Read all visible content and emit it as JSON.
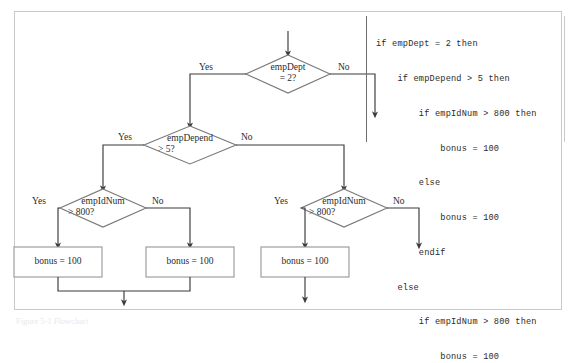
{
  "figure": {
    "caption": "Figure 5-1  Flowchart",
    "frame_color": "#c9c9c9"
  },
  "code": {
    "lines": [
      "if empDept = 2 then",
      "    if empDepend > 5 then",
      "        if empIdNum > 800 then",
      "            bonus = 100",
      "        else",
      "            bonus = 100",
      "        endif",
      "    else",
      "        if empIdNum > 800 then",
      "            bonus = 100"
    ],
    "rule_color": "#6e6e6e"
  },
  "flowchart": {
    "type": "decision-tree-flowchart",
    "line_color": "#3a3a3a",
    "decisions": [
      {
        "id": "d1",
        "line1": "empDept",
        "line2": "= 2?",
        "yes_label": "Yes",
        "no_label": "No",
        "cx": 288,
        "cy": 74
      },
      {
        "id": "d2",
        "line1": "empDepend",
        "line2": "> 5?",
        "yes_label": "Yes",
        "no_label": "No",
        "cx": 190,
        "cy": 145
      },
      {
        "id": "d3",
        "line1": "empIdNum",
        "line2": "> 800?",
        "yes_label": "Yes",
        "no_label": "No",
        "cx": 103,
        "cy": 208
      },
      {
        "id": "d4",
        "line1": "empIdNum",
        "line2": "> 800?",
        "yes_label": "Yes",
        "no_label": "No",
        "cx": 344,
        "cy": 208
      }
    ],
    "processes": [
      {
        "id": "p1",
        "text": "bonus = 100",
        "cx": 58,
        "cy": 262
      },
      {
        "id": "p2",
        "text": "bonus = 100",
        "cx": 190,
        "cy": 262
      },
      {
        "id": "p3",
        "text": "bonus = 100",
        "cx": 305,
        "cy": 262
      }
    ]
  }
}
